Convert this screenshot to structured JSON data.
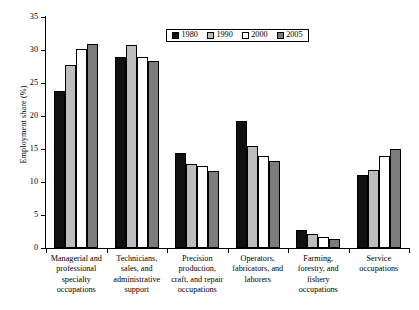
{
  "chart_data": {
    "type": "bar",
    "title": "",
    "xlabel": "",
    "ylabel": "Employment share (%)",
    "ylim": [
      0,
      35
    ],
    "yticks": [
      "0",
      "5",
      "10",
      "15",
      "20",
      "25",
      "30",
      "35"
    ],
    "grid": false,
    "legend_position": "top-center",
    "categories": [
      "Managerial and professional specialty occupations",
      "Technicians, sales, and administrative support",
      "Precision production, craft, and repair occupations",
      "Operators, fabricators, and laborers",
      "Farming, forestry, and fishery occupations",
      "Service occupations"
    ],
    "category_lines": [
      [
        "Managerial and",
        "professional",
        "specialty",
        "occupations"
      ],
      [
        "Technicians,",
        "sales, and",
        "administrative",
        "support"
      ],
      [
        "Precision",
        "production,",
        "craft, and repair",
        "occupations"
      ],
      [
        "Operators,",
        "fabricators, and",
        "laborers"
      ],
      [
        "Farming,",
        "forestry, and",
        "fishery",
        "occupations"
      ],
      [
        "Service",
        "occupations"
      ]
    ],
    "series": [
      {
        "name": "1980",
        "color": "#101010",
        "values": [
          23.8,
          28.9,
          14.4,
          19.2,
          2.8,
          11.1
        ]
      },
      {
        "name": "1990",
        "color": "#bdbdbd",
        "values": [
          27.8,
          30.8,
          12.7,
          15.5,
          2.1,
          11.8
        ]
      },
      {
        "name": "2000",
        "color": "#ffffff",
        "values": [
          30.1,
          29.0,
          12.4,
          14.0,
          1.7,
          14.0
        ]
      },
      {
        "name": "2005",
        "color": "#7c7c7c",
        "values": [
          30.9,
          28.4,
          11.7,
          13.2,
          1.4,
          15.0
        ]
      }
    ]
  }
}
